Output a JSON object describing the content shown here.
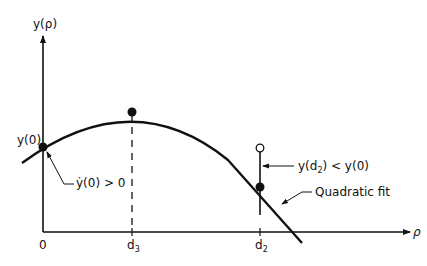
{
  "diagram": {
    "y_axis_label": "y(ρ)",
    "x_axis_label": "ρ",
    "x_ticks": [
      {
        "label": "0"
      },
      {
        "label": "d",
        "sub": "3"
      },
      {
        "label": "d",
        "sub": "2"
      }
    ],
    "point_labels": {
      "y0": "y(0)",
      "slope": "ẏ(0) > 0",
      "comparison_prefix": "y(d",
      "comparison_sub": "2",
      "comparison_suffix": ") < y(0)",
      "curve": "Quadratic fit"
    },
    "colors": {
      "ink": "#111111",
      "background": "#ffffff"
    }
  }
}
